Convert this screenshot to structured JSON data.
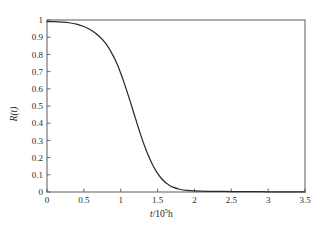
{
  "chart_data": {
    "type": "line",
    "title": "",
    "subtitle": "",
    "xlabel": "t/10⁵h",
    "xlabel_parts": {
      "variable": "t",
      "divider": "/10",
      "exponent": "5",
      "unit": "h"
    },
    "ylabel": "R(t)",
    "ylabel_parts": {
      "variable": "R",
      "argument": "(t)"
    },
    "xlim": [
      0,
      3.5
    ],
    "ylim": [
      0,
      1
    ],
    "grid": false,
    "legend": false,
    "legend_position": "none",
    "xticks": [
      0,
      0.5,
      1,
      1.5,
      2,
      2.5,
      3,
      3.5
    ],
    "xticklabels": [
      "0",
      "0.5",
      "1",
      "1.5",
      "2",
      "2.5",
      "3",
      "3.5"
    ],
    "yticks": [
      0,
      0.1,
      0.2,
      0.3,
      0.4,
      0.5,
      0.6,
      0.7,
      0.8,
      0.9,
      1
    ],
    "yticklabels": [
      "0",
      "0.1",
      "0.2",
      "0.3",
      "0.4",
      "0.5",
      "0.6",
      "0.7",
      "0.8",
      "0.9",
      "1"
    ],
    "tick_direction": "in",
    "frame": "box",
    "series": [
      {
        "name": "R(t)",
        "color": "#2b2b2b",
        "x": [
          0.0,
          0.1,
          0.2,
          0.3,
          0.4,
          0.5,
          0.6,
          0.7,
          0.8,
          0.9,
          0.95,
          1.0,
          1.05,
          1.1,
          1.15,
          1.2,
          1.25,
          1.3,
          1.35,
          1.4,
          1.45,
          1.5,
          1.55,
          1.6,
          1.65,
          1.7,
          1.8,
          1.9,
          2.0,
          2.2,
          2.4,
          2.6,
          2.8,
          3.0,
          3.2,
          3.4,
          3.5
        ],
        "y": [
          0.99,
          0.99,
          0.988,
          0.984,
          0.976,
          0.962,
          0.94,
          0.908,
          0.862,
          0.79,
          0.745,
          0.69,
          0.63,
          0.565,
          0.497,
          0.428,
          0.36,
          0.296,
          0.238,
          0.187,
          0.144,
          0.108,
          0.08,
          0.058,
          0.042,
          0.03,
          0.016,
          0.009,
          0.006,
          0.004,
          0.003,
          0.002,
          0.002,
          0.001,
          0.001,
          0.001,
          0.0
        ]
      }
    ],
    "annotations": []
  },
  "axes": {
    "plot_left_px": 47,
    "plot_right_px": 305,
    "plot_top_px": 20,
    "plot_bottom_px": 192
  },
  "colors": {
    "curve": "#2b2b2b",
    "frame": "#5a5a5a",
    "background": "#ffffff",
    "text": "#1a1a1a"
  }
}
